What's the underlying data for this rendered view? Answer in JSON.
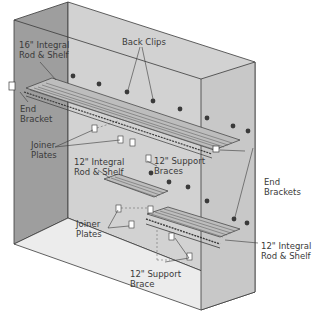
{
  "diagram": {
    "type": "isometric closet shelving installation",
    "colors": {
      "left_wall": "#9e9e9e",
      "back_wall": "#d2d2d2",
      "right_wall": "#c8c8c8",
      "floor": "#ececec",
      "outline": "#3a3a3a",
      "label_text": "#3a3a3a"
    },
    "labels": {
      "top_shelf": "16\" Integral\nRod & Shelf",
      "back_clips": "Back Clips",
      "end_bracket": "End\nBracket",
      "joiner_plates_top": "Joiner\nPlates",
      "mid_shelf": "12\" Integral\nRod & Shelf",
      "support_braces": "12\" Support\nBraces",
      "end_brackets": "End\nBrackets",
      "joiner_plates_bottom": "Joiner\nPlates",
      "bottom_shelf": "12\" Integral\nRod & Shelf",
      "support_brace": "12\" Support\nBrace"
    }
  }
}
